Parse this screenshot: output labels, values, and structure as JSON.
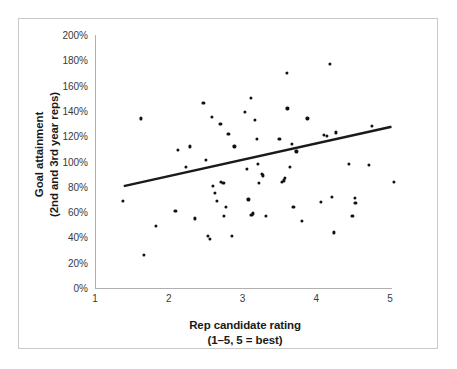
{
  "chart_data": {
    "type": "scatter",
    "title": "",
    "xlabel": "Rep candidate rating",
    "xlabel_sub": "(1–5, 5 = best)",
    "ylabel": "Goal attainment",
    "ylabel_sub": "(2nd and 3rd year reps)",
    "xlim": [
      1,
      5
    ],
    "ylim": [
      0,
      200
    ],
    "grid": false,
    "legend": null,
    "x_ticks": [
      1,
      2,
      3,
      4,
      5
    ],
    "x_tick_labels": [
      "1",
      "2",
      "3",
      "4",
      "5"
    ],
    "y_ticks": [
      0,
      20,
      40,
      60,
      80,
      100,
      120,
      140,
      160,
      180,
      200
    ],
    "y_tick_labels": [
      "0%",
      "20%",
      "40%",
      "60%",
      "80%",
      "100%",
      "120%",
      "140%",
      "160%",
      "180%",
      "200%"
    ],
    "point_color": "#111111",
    "trendline_color": "#1a1a1a",
    "axis_color": "#b0b0b0",
    "border_color": "#c9c9c9",
    "trendline": {
      "x_start": 1.39,
      "y_start": 80.5,
      "x_end": 5.02,
      "y_end": 127.5
    },
    "points": [
      [
        1.38,
        69
      ],
      [
        1.62,
        134
      ],
      [
        1.66,
        26
      ],
      [
        1.83,
        49
      ],
      [
        2.09,
        61
      ],
      [
        2.12,
        109
      ],
      [
        2.23,
        96
      ],
      [
        2.29,
        112
      ],
      [
        2.36,
        55
      ],
      [
        2.47,
        146
      ],
      [
        2.5,
        101
      ],
      [
        2.53,
        41
      ],
      [
        2.56,
        39
      ],
      [
        2.58,
        135
      ],
      [
        2.6,
        81
      ],
      [
        2.63,
        75
      ],
      [
        2.65,
        69
      ],
      [
        2.7,
        130
      ],
      [
        2.71,
        84
      ],
      [
        2.74,
        83
      ],
      [
        2.75,
        57
      ],
      [
        2.78,
        64
      ],
      [
        2.81,
        122
      ],
      [
        2.86,
        41
      ],
      [
        2.89,
        112
      ],
      [
        3.03,
        139
      ],
      [
        3.06,
        94
      ],
      [
        3.08,
        70
      ],
      [
        3.11,
        150
      ],
      [
        3.12,
        58
      ],
      [
        3.14,
        59
      ],
      [
        3.17,
        133
      ],
      [
        3.19,
        118
      ],
      [
        3.21,
        98
      ],
      [
        3.22,
        83
      ],
      [
        3.26,
        90
      ],
      [
        3.28,
        89
      ],
      [
        3.32,
        57
      ],
      [
        3.5,
        118
      ],
      [
        3.53,
        84
      ],
      [
        3.56,
        85
      ],
      [
        3.58,
        87
      ],
      [
        3.6,
        170
      ],
      [
        3.61,
        142
      ],
      [
        3.64,
        96
      ],
      [
        3.67,
        114
      ],
      [
        3.69,
        64
      ],
      [
        3.73,
        108
      ],
      [
        3.8,
        53
      ],
      [
        3.88,
        134
      ],
      [
        4.06,
        68
      ],
      [
        4.1,
        121
      ],
      [
        4.14,
        120
      ],
      [
        4.19,
        177
      ],
      [
        4.21,
        72
      ],
      [
        4.24,
        44
      ],
      [
        4.27,
        123
      ],
      [
        4.44,
        98
      ],
      [
        4.49,
        57
      ],
      [
        4.52,
        71
      ],
      [
        4.53,
        67
      ],
      [
        4.71,
        97
      ],
      [
        4.75,
        128
      ],
      [
        5.05,
        84
      ]
    ]
  }
}
